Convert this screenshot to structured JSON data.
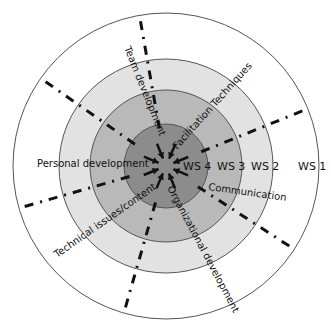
{
  "diagram": {
    "center": [
      166,
      166
    ],
    "rings": [
      {
        "id": "ws1",
        "label": "WS 1",
        "radius": 153,
        "fill": "#ffffff",
        "label_pos": [
          298,
          170
        ]
      },
      {
        "id": "ws2",
        "label": "WS 2",
        "radius": 107,
        "fill": "#e2e2e2",
        "label_pos": [
          251,
          170
        ]
      },
      {
        "id": "ws3",
        "label": "WS 3",
        "radius": 76,
        "fill": "#b9b9b9",
        "label_pos": [
          217,
          170
        ]
      },
      {
        "id": "ws4",
        "label": "WS 4",
        "radius": 42,
        "fill": "#8c8c8c",
        "label_pos": [
          183,
          170
        ]
      }
    ],
    "colors": {
      "stroke": "#555555",
      "dash_line": "#111111",
      "text": "#111111"
    },
    "divider_angles_deg": [
      145,
      100,
      22,
      -33,
      -106,
      196
    ],
    "topics": [
      {
        "label": "Team development",
        "x": 124,
        "y": 48,
        "rotate": 68,
        "anchor": "start"
      },
      {
        "label": "Facilitation Techniques",
        "x": 177,
        "y": 150,
        "rotate": -48,
        "anchor": "start"
      },
      {
        "label": "Personal development",
        "x": 37,
        "y": 167,
        "rotate": 0,
        "anchor": "start"
      },
      {
        "label": "Communication",
        "x": 208,
        "y": 190,
        "rotate": 8,
        "anchor": "start"
      },
      {
        "label": "Technical issues/content",
        "x": 57,
        "y": 258,
        "rotate": -35,
        "anchor": "start"
      },
      {
        "label": "Organizational development",
        "x": 167,
        "y": 188,
        "rotate": 62,
        "anchor": "start"
      }
    ],
    "arrows_count": 8
  }
}
